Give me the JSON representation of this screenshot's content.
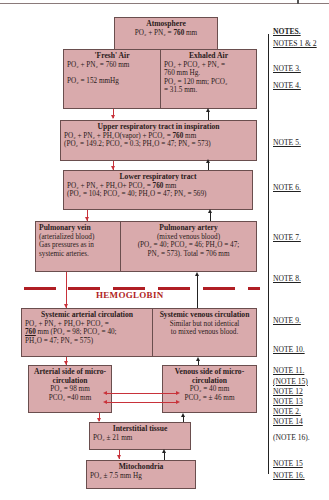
{
  "diagram": {
    "boxes": {
      "atmosphere": {
        "title": "Atmosphere",
        "line1": "PO₂ + PN₂ = ",
        "line1_bold": "760",
        "line1_end": " mm"
      },
      "fresh_air": {
        "title": "'Fresh' Air",
        "line1": "PO₂ + PN₂ = 760 mm",
        "line2": "PO₂ = 152 mmHg"
      },
      "exhaled_air": {
        "title": "Exhaled Air",
        "line1": "PO₂ + PCO₂ + PN₂ =",
        "line2": "760 mm Hg.",
        "line3": "PO₂ = 120 mm; PCO₂",
        "line4": "= 31.5 mm."
      },
      "upper_resp": {
        "title": "Upper respiratory tract in inspiration",
        "line1": "PO₂ + PN₂ + PH₂O(vapor) + PCO₂ = ",
        "line1_bold": "760",
        "line1_end": " mm",
        "line2": "(PO₂ = 149.2; PCO₂ = 0.3; PH₂O = 47; PN₂ = 573)"
      },
      "lower_resp": {
        "title": "Lower respiratory tract",
        "line1": "PO₂ + PN₂ + PH₂O+ PCO₂ = ",
        "line1_bold": "760",
        "line1_end": " mm",
        "line2": "(PO₂ = 104; PCO₂ = 40; PH₂O = 47; PN₂ = 569)"
      },
      "pulmonary_vein": {
        "title": "Pulmonary vein",
        "line1": "(arterialized blood)",
        "line2": "Gas pressures as in",
        "line3": "systemic arteries."
      },
      "pulmonary_artery": {
        "title": "Pulmonary artery",
        "line1": "(mixed venous blood)",
        "line2": "(PO₂ = 40; PCO₂ = 46; PH₂O = 47;",
        "line3": "PN₂ = 573). Total = 706 mm"
      },
      "systemic_arterial": {
        "title": "Systemic arterial circulation",
        "line1": "PO₂ + PN₂ + PH₂O+ PCO₂ =",
        "line2_bold": "760",
        "line2": " mm (PO₂ = 98; PCO₂ = 40;",
        "line3": "PH₂O = 47; PN₂ = 575)"
      },
      "systemic_venous": {
        "title": "Systemic venous circulation",
        "line1": "Similar but not identical",
        "line2": "to mixed venous blood."
      },
      "arterial_micro": {
        "title": "Arterial side of micro-circulation",
        "line1": "PO₂ = 98 mm",
        "line2": "PCO₂ =40 mm"
      },
      "venous_micro": {
        "title": "Venous side of micro-circulation",
        "line1": "PO₂ = 40 mm",
        "line2": "PCO₂ = ± 46 mm"
      },
      "interstitial": {
        "title": "Interstitial tissue",
        "line1": "PO₂ ± 21 mm"
      },
      "mitochondria": {
        "title": "Mitochondria",
        "line1": "PO₂ ± 7.5 mm Hg"
      }
    },
    "barrier_label": "HEMOGLOBIN",
    "colors": {
      "box_fill": "#d9aaac",
      "down_arrow": "#c8323a",
      "up_arrow": "#222222",
      "barrier": "#b01e24"
    }
  },
  "notes": {
    "header": "NOTES.",
    "items": [
      "NOTES 1 & 2",
      "NOTE 3.",
      "NOTE 4.",
      "NOTE 5.",
      "NOTE 6.",
      "NOTE 7.",
      "NOTE 8.",
      "NOTE 9.",
      "NOTE 10.",
      "NOTE 11.",
      "(NOTE 15)",
      "NOTE 12",
      "NOTE 13",
      "NOTE 2.",
      "NOTE 14",
      "(NOTE 16).",
      "NOTE 15",
      "NOTE 16."
    ]
  }
}
